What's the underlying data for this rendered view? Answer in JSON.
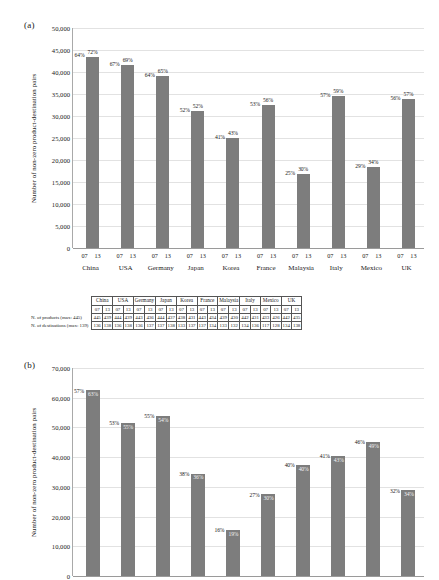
{
  "figure": {
    "panel_a_label": "(a)",
    "panel_b_label": "(b)"
  },
  "chart_data": [
    {
      "id": "panel-a",
      "type": "bar",
      "title": "",
      "panel": "(a)",
      "xlabel": "",
      "ylabel": "Number of non-zero product-destination pairs",
      "ylim": [
        0,
        50000
      ],
      "yticks": [
        "0",
        "5,000",
        "10,000",
        "15,000",
        "20,000",
        "25,000",
        "30,000",
        "35,000",
        "40,000",
        "45,000",
        "50,000"
      ],
      "ytick_values": [
        0,
        5000,
        10000,
        15000,
        20000,
        25000,
        30000,
        35000,
        40000,
        45000,
        50000
      ],
      "grid": true,
      "legend": "none",
      "categories": [
        "China",
        "USA",
        "Germany",
        "Japan",
        "Korea",
        "France",
        "Malaysia",
        "Italy",
        "Mexico",
        "UK"
      ],
      "subcategories": [
        "07",
        "13"
      ],
      "series": [
        {
          "name": "07",
          "values": [
            43500,
            41400,
            38900,
            31000,
            25000,
            32300,
            16700,
            34500,
            18200,
            33800
          ],
          "labels": [
            "64%",
            "67%",
            "64%",
            "52%",
            "41%",
            "53%",
            "25%",
            "57%",
            "29%",
            "56%"
          ]
        },
        {
          "name": "13",
          "values": [
            43500,
            41500,
            39000,
            31100,
            25100,
            32400,
            16750,
            34600,
            18300,
            33900
          ],
          "labels": [
            "72%",
            "69%",
            "65%",
            "52%",
            "43%",
            "56%",
            "30%",
            "59%",
            "34%",
            "57%"
          ]
        }
      ]
    },
    {
      "id": "panel-b",
      "type": "bar",
      "title": "",
      "panel": "(b)",
      "xlabel": "",
      "ylabel": "Number of non-zero product-destination pairs",
      "ylim": [
        0,
        70000
      ],
      "yticks": [
        "0",
        "10,000",
        "20,000",
        "30,000",
        "40,000",
        "50,000",
        "60,000",
        "70,000"
      ],
      "ytick_values": [
        0,
        10000,
        20000,
        30000,
        40000,
        50000,
        60000,
        70000
      ],
      "grid": true,
      "legend": "none",
      "categories": [
        "",
        "",
        "",
        "",
        "",
        "",
        "",
        "",
        "",
        ""
      ],
      "subcategories": [
        "07",
        "13"
      ],
      "series": [
        {
          "name": "07",
          "values": [
            62400,
            51400,
            53900,
            34400,
            15400,
            27400,
            37200,
            40400,
            45100,
            28700
          ],
          "labels": [
            "57%",
            "53%",
            "55%",
            "38%",
            "16%",
            "27%",
            "40%",
            "41%",
            "46%",
            "32%"
          ]
        },
        {
          "name": "13",
          "values": [
            62500,
            51500,
            54000,
            34500,
            15500,
            27500,
            37300,
            40500,
            45200,
            28800
          ],
          "labels": [
            "63%",
            "55%",
            "54%",
            "36%",
            "19%",
            "30%",
            "40%",
            "43%",
            "49%",
            "34%"
          ]
        }
      ]
    }
  ],
  "table": {
    "corner": "",
    "columns": [
      "China",
      "USA",
      "Germany",
      "Japan",
      "Korea",
      "France",
      "Malaysia",
      "Italy",
      "Mexico",
      "UK"
    ],
    "subheaders": [
      "07",
      "13"
    ],
    "rows": [
      {
        "label": "N. of products (max: 445)",
        "values": [
          [
            "445",
            "439"
          ],
          [
            "444",
            "439"
          ],
          [
            "443",
            "436"
          ],
          [
            "444",
            "437"
          ],
          [
            "438",
            "431"
          ],
          [
            "443",
            "434"
          ],
          [
            "439",
            "430"
          ],
          [
            "442",
            "431"
          ],
          [
            "433",
            "426"
          ],
          [
            "442",
            "435"
          ]
        ]
      },
      {
        "label": "N. of destinations (max: 139)",
        "values": [
          [
            "136",
            "138"
          ],
          [
            "136",
            "138"
          ],
          [
            "136",
            "137"
          ],
          [
            "137",
            "138"
          ],
          [
            "133",
            "137"
          ],
          [
            "137",
            "134"
          ],
          [
            "133",
            "132"
          ],
          [
            "134",
            "136"
          ],
          [
            "117",
            "128"
          ],
          [
            "134",
            "138"
          ]
        ]
      }
    ]
  },
  "colors": {
    "bar": "#808080",
    "grid": "#e2e2e2",
    "axis": "#9a9a9a",
    "text": "#1a1a1a"
  }
}
